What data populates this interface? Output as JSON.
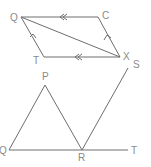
{
  "figure_top": {
    "shape": "parallelogram with diagonal",
    "labels": {
      "q": "Q",
      "c": "C",
      "t": "T",
      "x": "X",
      "s": "S"
    },
    "vertices": {
      "Q": [
        21,
        17
      ],
      "C": [
        98,
        17
      ],
      "X": [
        120,
        57
      ],
      "T": [
        44,
        57
      ]
    },
    "parallel_marks": "double arrows on QC and TX, single arrows on TQ and XC"
  },
  "figure_bottom": {
    "shape": "triangle with extended base and transversal",
    "labels": {
      "p": "P",
      "q": "Q",
      "r": "R",
      "t": "T"
    },
    "vertices": {
      "P": [
        45,
        85
      ],
      "Q": [
        9,
        150
      ],
      "R": [
        82,
        150
      ],
      "T_end": [
        128,
        150
      ],
      "S_end": [
        128,
        68
      ]
    }
  },
  "colors": {
    "line": "#6e6e6e",
    "label": "#8a8a8a",
    "background": "#ffffff"
  }
}
